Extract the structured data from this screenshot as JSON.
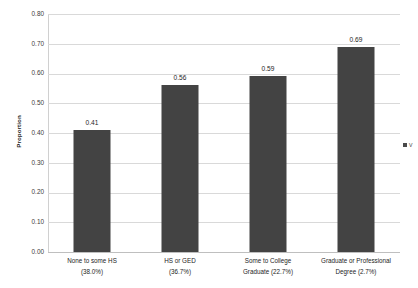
{
  "chart_data": {
    "type": "bar",
    "title": "",
    "xlabel": "",
    "ylabel": "Proportion",
    "ylim": [
      0.0,
      0.8
    ],
    "grid": true,
    "legend_position": "right-clipped",
    "categories": [
      "None to some HS (38.0%)",
      "HS or GED (36.7%)",
      "Some to College Graduate (22.7%)",
      "Graduate or Professional Degree (2.7%)"
    ],
    "values": [
      0.41,
      0.56,
      0.59,
      0.69
    ],
    "value_labels": [
      "0.41",
      "0.56",
      "0.59",
      "0.69"
    ],
    "ytick_labels": [
      "0.80",
      "0.70",
      "0.60",
      "0.50",
      "0.40",
      "0.30",
      "0.20",
      "0.10",
      "0.00"
    ],
    "ytick_values": [
      0.8,
      0.7,
      0.6,
      0.5,
      0.4,
      0.3,
      0.2,
      0.1,
      0.0
    ],
    "bar_color": "#434343",
    "gridline_color": "#d9d9d9",
    "background_color": "#ffffff"
  },
  "axes": {
    "y_title": "Proportion"
  },
  "x_categories": [
    {
      "line1": "None to some HS",
      "line2": "(38.0%)"
    },
    {
      "line1": "HS or GED",
      "line2": "(36.7%)"
    },
    {
      "line1": "Some to College",
      "line2": "Graduate (22.7%)"
    },
    {
      "line1": "Graduate or Professional",
      "line2": "Degree (2.7%)"
    }
  ],
  "legend": {
    "entry_label": "V"
  }
}
